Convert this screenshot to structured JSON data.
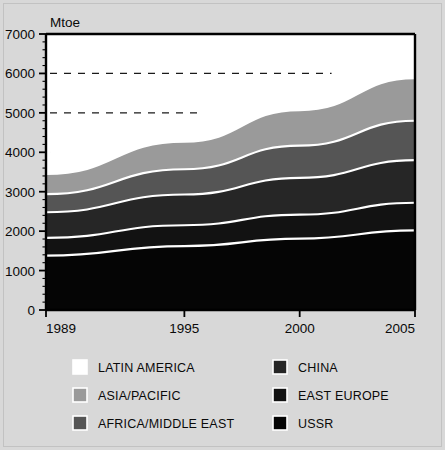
{
  "chart_data": {
    "type": "area",
    "stacked": true,
    "title": "",
    "xlabel": "",
    "ylabel": "Mtoe",
    "unit_label": "Mtoe",
    "x": [
      1989,
      1995,
      2000,
      2005
    ],
    "xtick_labels": [
      "1989",
      "1995",
      "2000",
      "2005"
    ],
    "xlim": [
      1989,
      2005
    ],
    "ylim": [
      0,
      7000
    ],
    "ytick_labels": [
      "0",
      "1000",
      "2000",
      "3000",
      "4000",
      "5000",
      "6000",
      "7000"
    ],
    "ytick_values": [
      0,
      1000,
      2000,
      3000,
      4000,
      5000,
      6000,
      7000
    ],
    "yminor_step": 200,
    "gridlines_dashed_at": [
      4000,
      5000,
      6000
    ],
    "grid": "partial-dashed",
    "legend_position": "below",
    "series": [
      {
        "name": "USSR",
        "color": "#050505",
        "values": [
          1380,
          1620,
          1810,
          2020
        ]
      },
      {
        "name": "EAST EUROPE",
        "color": "#121212",
        "values": [
          450,
          530,
          610,
          700
        ]
      },
      {
        "name": "CHINA",
        "color": "#262626",
        "values": [
          650,
          780,
          930,
          1080
        ]
      },
      {
        "name": "AFRICA/MIDDLE EAST",
        "color": "#555555",
        "values": [
          460,
          640,
          820,
          1000
        ]
      },
      {
        "name": "ASIA/PACIFIC",
        "color": "#9a9a9a",
        "values": [
          510,
          700,
          900,
          1080
        ]
      },
      {
        "name": "LATIN AMERICA",
        "color": "#ffffff",
        "values": [
          500,
          570,
          650,
          740
        ]
      }
    ],
    "series_totals": [
      3950,
      4840,
      5720,
      6620
    ],
    "separator_color": "#ffffff"
  },
  "legend": {
    "columns": [
      {
        "items": [
          {
            "label": "LATIN AMERICA",
            "color": "#ffffff"
          },
          {
            "label": "ASIA/PACIFIC",
            "color": "#9a9a9a"
          },
          {
            "label": "AFRICA/MIDDLE EAST",
            "color": "#555555"
          }
        ]
      },
      {
        "items": [
          {
            "label": "CHINA",
            "color": "#262626"
          },
          {
            "label": "EAST EUROPE",
            "color": "#121212"
          },
          {
            "label": "USSR",
            "color": "#050505"
          }
        ]
      }
    ]
  },
  "plot": {
    "left": 46,
    "right": 415,
    "top": 34,
    "bottom": 310,
    "axis_color": "#000000",
    "background": "#ffffff"
  }
}
